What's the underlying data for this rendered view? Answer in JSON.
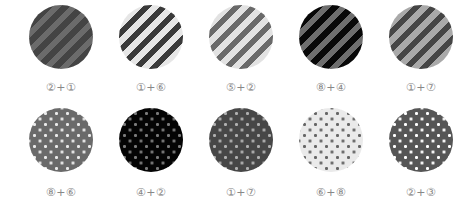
{
  "rows": [
    {
      "pattern": "stripes",
      "swatches": [
        {
          "label": "②+①",
          "base": "#444444",
          "accent": "#6b6b6b"
        },
        {
          "label": "①+⑥",
          "base": "#e6e6e6",
          "accent": "#3a3a3a"
        },
        {
          "label": "⑤+②",
          "base": "#e2e2e2",
          "accent": "#6a6a6a"
        },
        {
          "label": "⑧+④",
          "base": "#080808",
          "accent": "#6e6e6e"
        },
        {
          "label": "①+⑦",
          "base": "#a9a9a9",
          "accent": "#454545"
        }
      ]
    },
    {
      "pattern": "dots",
      "swatches": [
        {
          "label": "⑧+⑥",
          "base": "#6a6a6a",
          "accent": "#eaeaea"
        },
        {
          "label": "④+②",
          "base": "#040404",
          "accent": "#7a7a7a"
        },
        {
          "label": "①+⑦",
          "base": "#474747",
          "accent": "#b0b0b0"
        },
        {
          "label": "⑥+⑧",
          "base": "#eaeaea",
          "accent": "#666666"
        },
        {
          "label": "②+③",
          "base": "#565656",
          "accent": "#ffffff"
        }
      ]
    }
  ]
}
